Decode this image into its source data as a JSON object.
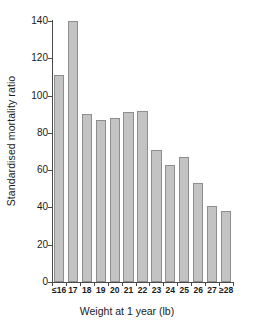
{
  "chart_data": {
    "type": "bar",
    "title": "",
    "subtitle": "",
    "xlabel": "Weight at 1 year (lb)",
    "ylabel": "Standardised mortality ratio",
    "categories": [
      "≤16",
      "17",
      "18",
      "19",
      "20",
      "21",
      "22",
      "23",
      "24",
      "25",
      "26",
      "27",
      "≥28"
    ],
    "values": [
      111,
      140,
      90,
      87,
      88,
      91,
      92,
      71,
      63,
      67,
      53,
      41,
      38
    ],
    "ylim": [
      0,
      140
    ],
    "ytick_labels": [
      "0",
      "20",
      "40",
      "60",
      "80",
      "100",
      "120",
      "140"
    ],
    "ytick_values": [
      0,
      20,
      40,
      60,
      80,
      100,
      120,
      140
    ],
    "grid": false,
    "legend": null,
    "legend_position": "none",
    "annotations": [],
    "bar_color": "#c3c3c3",
    "bar_edge_color": "#8e8e8e",
    "axis_color": "#4a4a4a",
    "text_color": "#1a1a1a",
    "background_color": "#ffffff"
  }
}
